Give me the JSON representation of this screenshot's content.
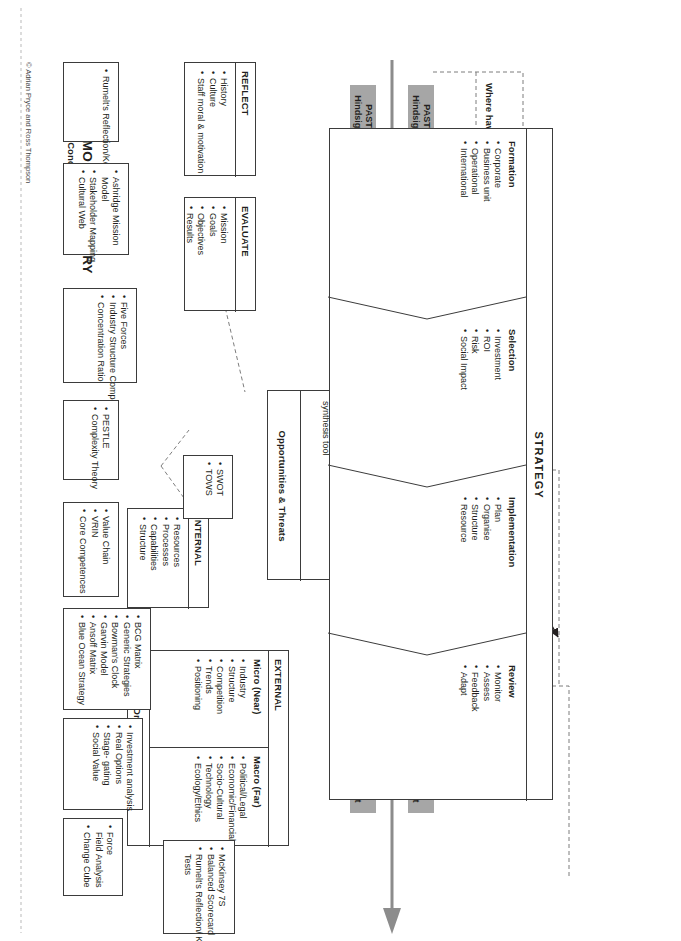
{
  "meta": {
    "directory_title": "STRATEGY MODEL DIRECTORY",
    "directory_subtitle": "Relevant Models, Concepts & Frameworks",
    "copyright": "© Adrian Pryce and Ross Thompson",
    "accent_gray": "#a6a6a6",
    "line_color": "#3b3b3b",
    "dash_color": "#7d7d7d"
  },
  "phases": [
    {
      "id": "past",
      "line1": "PAST",
      "line2": "Hindsight"
    },
    {
      "id": "present",
      "line1": "PRESENT",
      "line2": "Insight"
    },
    {
      "id": "future",
      "line1": "FUTURE",
      "line2": "Foresight"
    }
  ],
  "phases_right": [
    {
      "id": "past-r",
      "line1": "PAST",
      "line2": "Hindsight"
    },
    {
      "id": "present-r",
      "line1": "PRESENT",
      "line2": "Insight"
    },
    {
      "id": "future-r",
      "line1": "FUTURE",
      "line2": "Foresight"
    }
  ],
  "questions": [
    {
      "id": "q-past",
      "label": "Where have we come from?"
    },
    {
      "id": "q-present",
      "label": "Where are we now?"
    },
    {
      "id": "q-select",
      "label": "Where should we go?"
    },
    {
      "id": "q-future",
      "label": "How do we get there?"
    }
  ],
  "fit_labels": {
    "internal_external": "FIT?",
    "timeline": "FIT?"
  },
  "boxes": {
    "reflect": {
      "title": "REFLECT",
      "items": [
        "History",
        "Culture",
        "Staff moral & motivation"
      ]
    },
    "evaluate": {
      "title": "EVALUATE",
      "items": [
        "Mission",
        "Goals",
        "Objectives",
        "Results"
      ]
    },
    "internal": {
      "title": "INTERNAL",
      "items": [
        "Resources",
        "Processes",
        "Capabilities",
        "Structure"
      ]
    },
    "external": {
      "title": "EXTERNAL",
      "footer": "Drivers of change",
      "micro": {
        "title": "Micro (Near)",
        "items": [
          "Industry",
          "Structure",
          "Competition",
          "Trends",
          "Positioning"
        ]
      },
      "macro": {
        "title": "Macro (Far)",
        "items": [
          "Political/Legal",
          "Economic/Financial",
          "Socio-Cultural",
          "Technology",
          "Ecology/Ethics"
        ]
      }
    },
    "swot": {
      "top_title": "Strengths & Weaknesses",
      "mid_line1": "SWOT",
      "mid_line2": "2nd stage",
      "mid_line3": "synthesis tool",
      "mid_items": [
        "Exploit SO",
        "Mitigate WT"
      ],
      "bottom_title": "Opportunities & Threats"
    },
    "strategy": {
      "title": "STRATEGY",
      "stages": [
        {
          "title": "Formation",
          "items": [
            "Corporate",
            "Business unit",
            "Operational",
            "International"
          ]
        },
        {
          "title": "Selection",
          "items": [
            "Investment",
            "ROI",
            "Risk",
            "Social Impact"
          ]
        },
        {
          "title": "Implementation",
          "items": [
            "Plan",
            "Organise",
            "Structure",
            "Resource"
          ]
        },
        {
          "title": "Review",
          "items": [
            "Monitor",
            "Assess",
            "Feedback",
            "Adapt"
          ]
        }
      ]
    }
  },
  "directory": [
    {
      "id": "dir-reflect",
      "items": [
        "Rumelt's Reflection/Key Tests"
      ]
    },
    {
      "id": "dir-evaluate",
      "items": [
        "Ashridge Mission Model",
        "Stakeholder Mapping",
        "Cultural Web"
      ]
    },
    {
      "id": "dir-micro",
      "items": [
        "Five Forces",
        "Industry Structure Competitive Analysis",
        "Concentration Ratio"
      ]
    },
    {
      "id": "dir-macro",
      "items": [
        "PESTLE",
        "Complexity Theory"
      ]
    },
    {
      "id": "dir-internal",
      "items": [
        "Value Chain",
        "VRIN",
        "Core Competences"
      ]
    },
    {
      "id": "dir-swot",
      "items": [
        "SWOT",
        "TOWS"
      ]
    },
    {
      "id": "dir-formation",
      "items": [
        "BCG Matrix",
        "Generic Strategies",
        "Bowman's Clock",
        "Garvin Model",
        "Ansoff Matrix",
        "Blue Ocean Strategy"
      ]
    },
    {
      "id": "dir-selection",
      "items": [
        "Investment analysis",
        "Real Options",
        "Stage- gating",
        "Social Value"
      ]
    },
    {
      "id": "dir-implement",
      "items": [
        "Force Field Analysis",
        "Change Cube"
      ]
    },
    {
      "id": "dir-review",
      "items": [
        "McKinsey 7S",
        "Balanced Scorecard",
        "Rumelt's Reflection/ Key Tests"
      ]
    }
  ]
}
